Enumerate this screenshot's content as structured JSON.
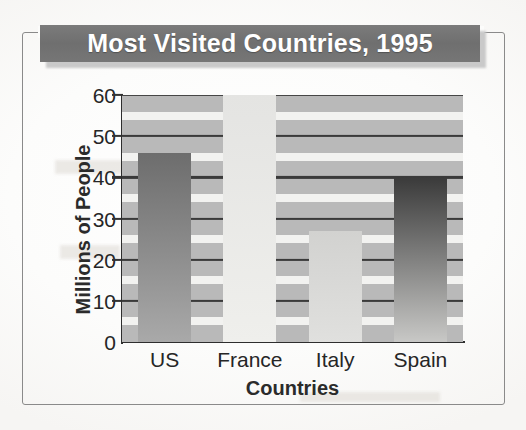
{
  "figure": {
    "title": "Most Visited Countries, 1995",
    "title_bg_color": "#6f6f6f",
    "title_text_color": "#ffffff",
    "frame_color": "#8a8a8a",
    "paper_color": "#fbfbfa"
  },
  "chart_data": {
    "type": "bar",
    "title": "Most Visited Countries, 1995",
    "xlabel": "Countries",
    "ylabel": "Millions of People",
    "categories": [
      "US",
      "France",
      "Italy",
      "Spain"
    ],
    "values": [
      46,
      60,
      27,
      40
    ],
    "ylim": [
      0,
      60
    ],
    "yticks": [
      0,
      10,
      20,
      30,
      40,
      50,
      60
    ],
    "ytick_labels": [
      "0",
      "10",
      "20",
      "30",
      "40",
      "50",
      "60"
    ],
    "grid": true,
    "gridlines_at": [
      10,
      20,
      30,
      40,
      50,
      60
    ],
    "bands_at": [
      5,
      15,
      25,
      35,
      45,
      55
    ],
    "legend": false,
    "plot_bg_color": "#b9b9b9",
    "gridline_color": "#3a3a3a",
    "band_color": "#f2f2f0",
    "bars": [
      {
        "label": "US",
        "value": 46,
        "top_color": "#6d6d6d",
        "bottom_color": "#a9a9a9"
      },
      {
        "label": "France",
        "value": 60,
        "top_color": "#e4e4e2",
        "bottom_color": "#efefec"
      },
      {
        "label": "Italy",
        "value": 27,
        "top_color": "#d2d2d0",
        "bottom_color": "#e0e0de"
      },
      {
        "label": "Spain",
        "value": 40,
        "top_color": "#3a3a3a",
        "bottom_color": "#c8c8c6"
      }
    ]
  }
}
